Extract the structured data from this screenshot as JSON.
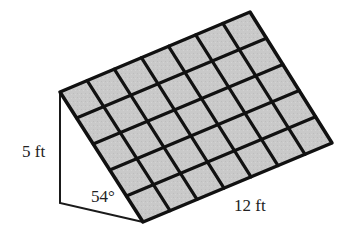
{
  "diagram": {
    "grid": {
      "columns": 7,
      "rows": 5
    },
    "labels": {
      "height": "5 ft",
      "angle": "54°",
      "length": "12 ft"
    },
    "colors": {
      "tile_fill": "#c9c9c9",
      "grid_line": "#111111",
      "support_line": "#1a1a1a",
      "text": "#222222"
    },
    "geometry": {
      "panel_top_left": [
        60,
        92
      ],
      "panel_top_right": [
        250,
        12
      ],
      "panel_bottom_right": [
        332,
        143
      ],
      "panel_bottom_left": [
        143,
        222
      ],
      "support_bottom_left": [
        60,
        203
      ]
    }
  }
}
